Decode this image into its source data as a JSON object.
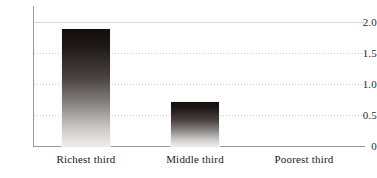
{
  "chart_data": {
    "type": "bar",
    "title": "",
    "subtitle": "",
    "xlabel": "",
    "ylabel": "",
    "categories": [
      "Richest third",
      "Middle third",
      "Poorest third"
    ],
    "values": [
      1.89,
      0.71,
      0
    ],
    "ylim": [
      0,
      2.0
    ],
    "yticks": [
      0,
      0.5,
      1.0,
      1.5,
      2.0
    ],
    "ytick_labels": [
      "0",
      "0.5",
      "1.0",
      "1.5",
      "2.0"
    ],
    "grid": "horizontal-dotted",
    "legend": "none",
    "bar_style": "vertical-gradient-dark-to-light",
    "annotations": []
  },
  "axes": {
    "y_ticks": [
      {
        "label": "2.0",
        "value": 2.0
      },
      {
        "label": "1.5",
        "value": 1.5
      },
      {
        "label": "1.0",
        "value": 1.0
      },
      {
        "label": "0.5",
        "value": 0.5
      },
      {
        "label": "0",
        "value": 0
      }
    ],
    "x_ticks": [
      {
        "label": "Richest third"
      },
      {
        "label": "Middle third"
      },
      {
        "label": "Poorest third"
      }
    ]
  },
  "colors": {
    "background": "#ffffff",
    "axis": "#9a9a9a",
    "gridline": "#c9c9c9",
    "bar_top": "#130f0d",
    "bar_bottom": "#ededec",
    "text": "#24201d"
  }
}
